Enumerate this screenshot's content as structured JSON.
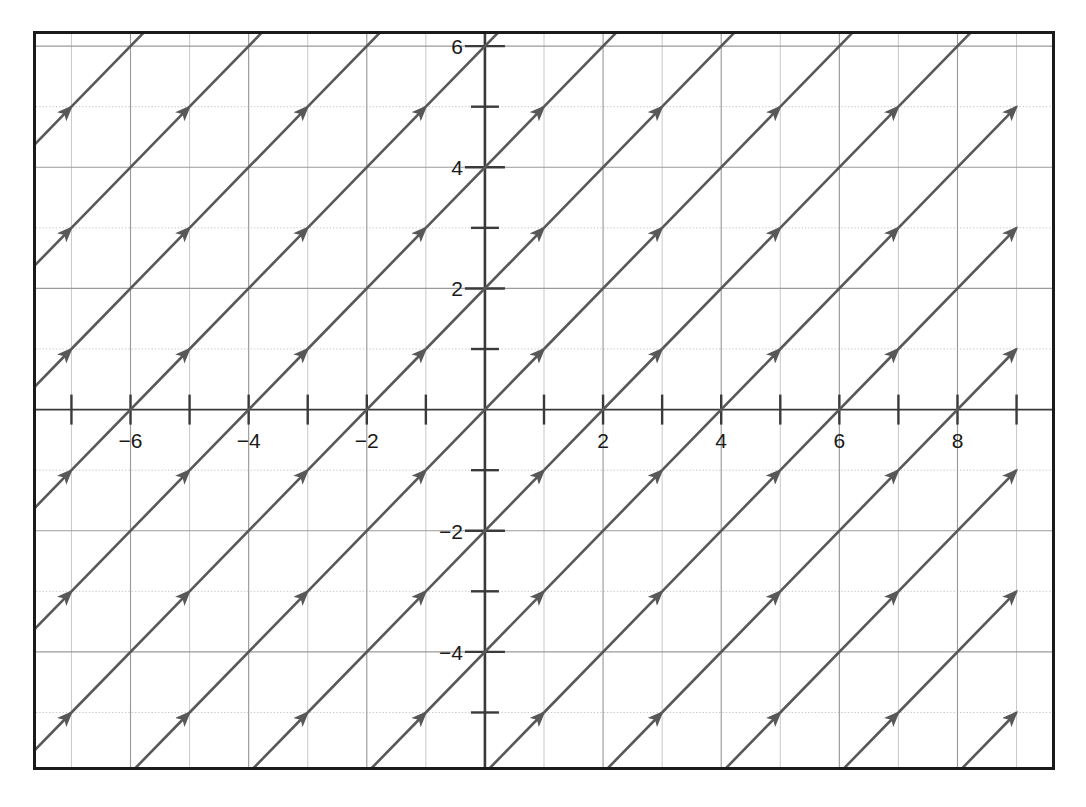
{
  "figure": {
    "kind": "slope-field",
    "border_color": "#1a1a1a",
    "background": "#ffffff",
    "arrow_color": "#585858",
    "axis_color": "#3a3a3a",
    "grid_major_color": "#9a9a9a",
    "grid_minor_color": "#c8c8c8"
  },
  "chart_data": {
    "type": "scatter",
    "title": "",
    "subtitle": "",
    "xlabel": "",
    "ylabel": "",
    "grid": true,
    "legend": "none",
    "slope": 1,
    "arrow_angle_deg": 45,
    "xlim": [
      -7.6,
      9.6
    ],
    "ylim": [
      -5.9,
      6.2
    ],
    "x_major_ticks": [
      -8,
      -6,
      -4,
      -2,
      0,
      2,
      4,
      6,
      8
    ],
    "x_minor_ticks": [
      -7,
      -5,
      -3,
      -1,
      1,
      3,
      5,
      7,
      9
    ],
    "y_major_ticks": [
      -4,
      -2,
      0,
      2,
      4,
      6
    ],
    "y_minor_ticks": [
      -5,
      -3,
      -1,
      1,
      3,
      5
    ],
    "x_tick_labels": [
      "−6",
      "−4",
      "−2",
      "2",
      "4",
      "6",
      "8"
    ],
    "x_tick_label_values": [
      -6,
      -4,
      -2,
      2,
      4,
      6,
      8
    ],
    "y_tick_labels": [
      "6",
      "4",
      "2",
      "−2",
      "−4"
    ],
    "y_tick_label_values": [
      6,
      4,
      2,
      -2,
      -4
    ],
    "arrow_x_positions": [
      -8,
      -6,
      -4,
      -2,
      0,
      2,
      4,
      6,
      8
    ],
    "arrow_y_positions": [
      -6,
      -4,
      -2,
      0,
      2,
      4,
      6
    ],
    "arrow_length_units": 2.0,
    "grid_step_x": 1,
    "grid_step_y": 1,
    "series": [
      {
        "name": "dy/dx = 1 direction field",
        "values": [
          1,
          1,
          1,
          1,
          1,
          1,
          1,
          1,
          1
        ],
        "note": "constant slope at every grid point"
      }
    ]
  },
  "axes": {
    "x_axis_label": "",
    "y_axis_label": "",
    "origin_label": ""
  }
}
